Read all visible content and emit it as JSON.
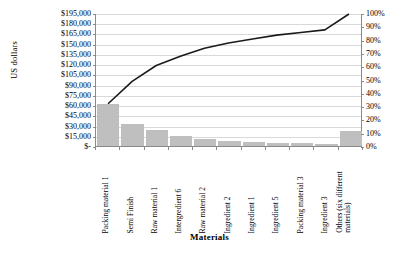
{
  "chart_data": {
    "type": "bar",
    "title": "",
    "xlabel": "Materials",
    "ylabel": "US dollars",
    "ylabel_secondary": "",
    "grid": true,
    "legend": "none",
    "ylim": [
      0,
      195000
    ],
    "ylim_secondary": [
      0,
      100
    ],
    "ytick_labels": [
      "$195,000",
      "$180,000",
      "$165,000",
      "$150,000",
      "$135,000",
      "$120,000",
      "$105,000",
      "$90,000",
      "$75,000",
      "$60,000",
      "$45,000",
      "$30,000",
      "$15,000",
      "$-"
    ],
    "ytick_values": [
      195000,
      180000,
      165000,
      150000,
      135000,
      120000,
      105000,
      90000,
      75000,
      60000,
      45000,
      30000,
      15000,
      0
    ],
    "ytick_labels_secondary": [
      "100%",
      "90%",
      "80%",
      "70%",
      "60%",
      "50%",
      "40%",
      "30%",
      "20%",
      "10%",
      "0%"
    ],
    "ytick_values_secondary": [
      100,
      90,
      80,
      70,
      60,
      50,
      40,
      30,
      20,
      10,
      0
    ],
    "categories": [
      "Packing material 1",
      "Semi Finish",
      "Raw material 1",
      "Intergredient 6",
      "Raw material 2",
      "Ingredient 2",
      "Ingredient 1",
      "Ingredient 5",
      "Packing material 3",
      "Ingredient 3",
      "Others (six different materials)"
    ],
    "series": [
      {
        "name": "Cost",
        "type": "bar",
        "axis": "left",
        "color": "#bfbfbf",
        "values": [
          62000,
          33000,
          23000,
          14000,
          11000,
          8000,
          6000,
          5000,
          4000,
          3000,
          22000
        ]
      },
      {
        "name": "Cumulative percentage",
        "type": "line",
        "axis": "right",
        "color": "#1a1a1a",
        "values": [
          32,
          49,
          61,
          68,
          74,
          78,
          81,
          84,
          86,
          88,
          100
        ]
      }
    ]
  }
}
